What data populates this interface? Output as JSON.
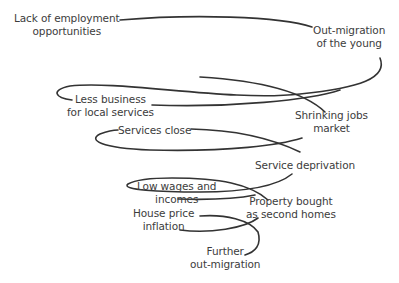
{
  "diagram": {
    "type": "downward spiral",
    "line_color": "#333333",
    "nodes": [
      {
        "id": "lack-employment",
        "lines": [
          "Lack of employment",
          "opportunities"
        ]
      },
      {
        "id": "out-migration-young",
        "lines": [
          "Out-migration",
          "of the young"
        ]
      },
      {
        "id": "less-business",
        "lines": [
          "Less business",
          "for local services"
        ]
      },
      {
        "id": "shrinking-jobs",
        "lines": [
          "Shrinking jobs",
          "market"
        ]
      },
      {
        "id": "services-close",
        "lines": [
          "Services close"
        ]
      },
      {
        "id": "service-deprivation",
        "lines": [
          "Service deprivation"
        ]
      },
      {
        "id": "low-wages",
        "lines": [
          "Low wages and",
          "incomes"
        ]
      },
      {
        "id": "property-second-homes",
        "lines": [
          "Property bought",
          "as second homes"
        ]
      },
      {
        "id": "house-price",
        "lines": [
          "House price",
          "inflation"
        ]
      },
      {
        "id": "further-out-migration",
        "lines": [
          "Further",
          "out-migration"
        ]
      }
    ]
  }
}
